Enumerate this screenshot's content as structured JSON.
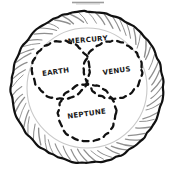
{
  "figure": {
    "kind": "hand-drawn-venn-diagram",
    "title_visible": false,
    "background_color": "#ffffff",
    "ink_color": "#111111",
    "faint_ink_color": "#c9c9c9",
    "top_edge_artifact": true
  },
  "outer_ring": {
    "name": "hatched-outer-ring",
    "stroke_color": "#111111",
    "hatch_count": 56,
    "center_x": 87,
    "center_y": 87,
    "outer_radius": 76,
    "inner_radius": 64
  },
  "faint_inner_circle": {
    "name": "faint-inner-circle",
    "stroke_color": "#c9c9c9",
    "center_x": 87,
    "center_y": 88,
    "radius": 60
  },
  "sets": [
    {
      "id": "earth",
      "label": "EARTH",
      "cx": 61,
      "cy": 70,
      "r": 29,
      "label_x": 56,
      "label_y": 74,
      "label_rotation": -8,
      "stroke_style": "dashed"
    },
    {
      "id": "venus",
      "label": "VENUS",
      "cx": 113,
      "cy": 70,
      "r": 29,
      "label_x": 117,
      "label_y": 73,
      "label_rotation": -8,
      "stroke_style": "dashed"
    },
    {
      "id": "neptune",
      "label": "NEPTUNE",
      "cx": 87,
      "cy": 113,
      "r": 29,
      "label_x": 87,
      "label_y": 116,
      "label_rotation": -8,
      "stroke_style": "dashed"
    }
  ],
  "intersection_labels": [
    {
      "id": "mercury",
      "label": "MERCURY",
      "label_x": 88,
      "label_y": 42,
      "label_rotation": -5,
      "region": "earth-venus-top-overlap"
    }
  ],
  "label_font_size_px": 7
}
